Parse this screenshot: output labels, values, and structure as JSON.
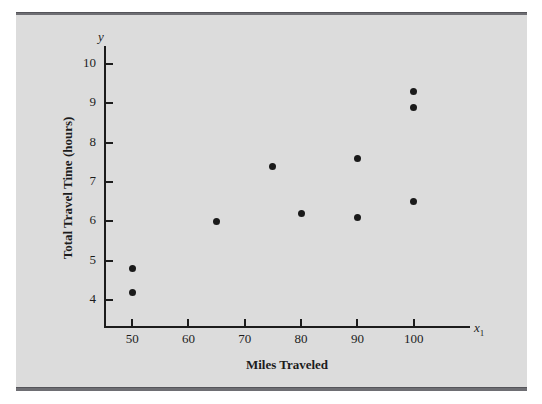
{
  "figure": {
    "panel_color": "#dcdcdc",
    "rule_color": "#6e6e73",
    "marker_color": "#1a1a1a",
    "axis_color": "#1c1c1c"
  },
  "chart_data": {
    "type": "scatter",
    "title": "",
    "xlabel": "Miles Traveled",
    "ylabel": "Total Travel Time (hours)",
    "x_axis_symbol": "x",
    "x_axis_symbol_sub": "1",
    "y_axis_symbol": "y",
    "xlim": [
      45,
      110
    ],
    "ylim": [
      3.35,
      10.45
    ],
    "xticks": [
      50,
      60,
      70,
      80,
      90,
      100
    ],
    "xticklabels": [
      "50",
      "60",
      "70",
      "80",
      "90",
      "100"
    ],
    "yticks": [
      4,
      5,
      6,
      7,
      8,
      9,
      10
    ],
    "yticklabels": [
      "4",
      "5",
      "6",
      "7",
      "8",
      "9",
      "10"
    ],
    "grid": false,
    "legend": null,
    "points": [
      {
        "x": 50,
        "y": 4.8
      },
      {
        "x": 50,
        "y": 4.2
      },
      {
        "x": 65,
        "y": 6.0
      },
      {
        "x": 75,
        "y": 7.4
      },
      {
        "x": 80,
        "y": 6.2
      },
      {
        "x": 90,
        "y": 7.6
      },
      {
        "x": 90,
        "y": 6.1
      },
      {
        "x": 100,
        "y": 9.3
      },
      {
        "x": 100,
        "y": 8.9
      },
      {
        "x": 100,
        "y": 6.5
      }
    ]
  }
}
